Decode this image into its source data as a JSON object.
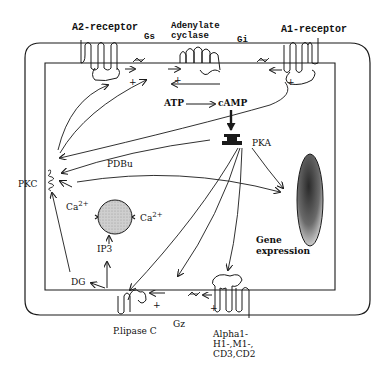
{
  "diagram": {
    "type": "cell-signaling-pathway",
    "labels": {
      "a2_receptor": "A2-receptor",
      "gs": "Gs",
      "adenylate_cyclase": [
        "Adenylate",
        "cyclase"
      ],
      "gi": "Gi",
      "a1_receptor": "A1-receptor",
      "atp": "ATP",
      "camp": "cAMP",
      "pka": "PKA",
      "pdbu": "PDBu",
      "pkc": "PKC",
      "ca_left": "Ca",
      "ca_left_sup": "2+",
      "ca_right": "Ca",
      "ca_right_sup": "2+",
      "ip3": "IP3",
      "dg": "DG",
      "gene_expression": [
        "Gene",
        "expression"
      ],
      "plipase_c": "P.lipase C",
      "gz": "Gz",
      "receptors_bottom": [
        "Alpha1-",
        "H1-,M1-,",
        "CD3,CD2"
      ]
    },
    "signs": {
      "plus": "+"
    },
    "colors": {
      "line": "#1a1a1a",
      "er_fill": "#c8c8c8",
      "nucleus_dark": "#3a3a3a",
      "nucleus_light": "#d8d8d8"
    }
  }
}
